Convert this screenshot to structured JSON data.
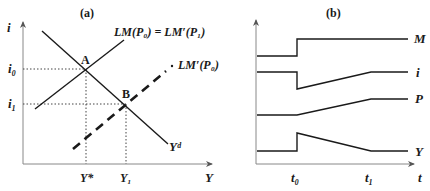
{
  "panel_a": {
    "title": "(a)",
    "y_axis_label": "i",
    "x_axis_label": "Y",
    "curves": {
      "lm_label": "LM(P₀) = LM′(P₁)",
      "lm_shifted_label": "LM′(P₀)",
      "demand_label": "Yᵈ"
    },
    "points": {
      "a": "A",
      "b": "B"
    },
    "y_ticks": {
      "i0": "i₀",
      "i1": "i₁"
    },
    "x_ticks": {
      "ystar": "Y*",
      "y1": "Y₁"
    }
  },
  "panel_b": {
    "title": "(b)",
    "x_axis_label": "t",
    "x_ticks": {
      "t0": "t₀",
      "t1": "t₁"
    },
    "series_labels": {
      "m": "M",
      "i": "i",
      "p": "P",
      "y": "Y"
    }
  },
  "colors": {
    "ink": "#1a1a1a",
    "axis": "#777777"
  }
}
